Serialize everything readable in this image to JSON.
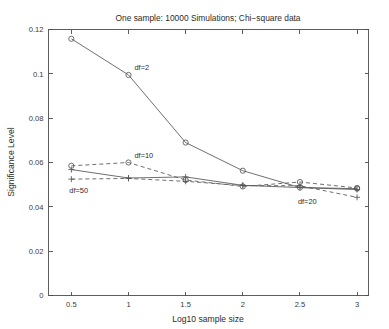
{
  "chart_data": {
    "type": "line",
    "title": "One sample: 10000 Simulations; Chi−square data",
    "xlabel": "Log10 sample size",
    "ylabel": "Significance Level",
    "x": [
      0.5,
      1,
      1.5,
      2,
      2.5,
      3
    ],
    "xlim": [
      0.3,
      3.1
    ],
    "ylim": [
      0,
      0.12
    ],
    "xticks": [
      "0.5",
      "1",
      "1.5",
      "2",
      "2.5",
      "3"
    ],
    "xtick_values": [
      0.5,
      1,
      1.5,
      2,
      2.5,
      3
    ],
    "yticks": [
      "0",
      "0.02",
      "0.04",
      "0.06",
      "0.08",
      "0.1",
      "0.12"
    ],
    "ytick_values": [
      0,
      0.02,
      0.04,
      0.06,
      0.08,
      0.1,
      0.12
    ],
    "grid": false,
    "legend_position": "inline-annotations",
    "series": [
      {
        "name": "df=2",
        "label": "df=2",
        "linestyle": "solid",
        "marker": "circle",
        "color": "#555555",
        "values": [
          0.1158,
          0.0995,
          0.069,
          0.0563,
          0.0487,
          0.0482
        ],
        "annotation": {
          "x": 1.0,
          "y": 0.1,
          "dx": 6,
          "dy": -4
        }
      },
      {
        "name": "df=10",
        "label": "df=10",
        "linestyle": "dashed",
        "marker": "circle",
        "color": "#555555",
        "values": [
          0.0585,
          0.06,
          0.0521,
          0.0492,
          0.0512,
          0.0485
        ],
        "annotation": {
          "x": 1.0,
          "y": 0.06,
          "dx": 6,
          "dy": -5
        }
      },
      {
        "name": "df=20",
        "label": "df=20",
        "linestyle": "solid",
        "marker": "plus",
        "color": "#555555",
        "values": [
          0.0568,
          0.053,
          0.0535,
          0.0497,
          0.0487,
          0.0478
        ],
        "annotation": {
          "x": 2.5,
          "y": 0.0487,
          "dx": -2,
          "dy": 16
        }
      },
      {
        "name": "df=50",
        "label": "df=50",
        "linestyle": "dashed",
        "marker": "plus",
        "color": "#555555",
        "values": [
          0.0525,
          0.0528,
          0.0515,
          0.0496,
          0.0495,
          0.0443
        ],
        "annotation": {
          "x": 0.5,
          "y": 0.0525,
          "dx": -2,
          "dy": 14
        }
      }
    ]
  },
  "figure": {
    "background_color": "#ffffff",
    "axis_color": "#4d4d4d",
    "line_color": "#555555",
    "text_color": "#2b2b2b"
  }
}
